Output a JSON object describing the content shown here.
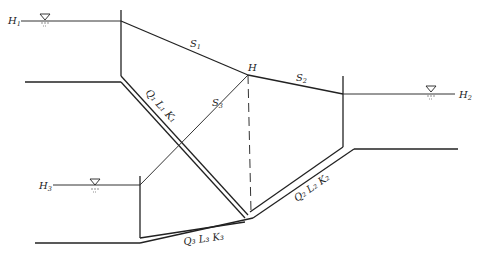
{
  "diagram": {
    "type": "three-reservoir pipe network",
    "reservoirs": [
      {
        "id": "reservoir-1",
        "head_label": "H",
        "head_sub": "1"
      },
      {
        "id": "reservoir-2",
        "head_label": "H",
        "head_sub": "2"
      },
      {
        "id": "reservoir-3",
        "head_label": "H",
        "head_sub": "3"
      }
    ],
    "junction": {
      "label": "H"
    },
    "hydraulic_grade_lines": [
      {
        "label": "S",
        "sub": "1"
      },
      {
        "label": "S",
        "sub": "2"
      },
      {
        "label": "S",
        "sub": "3"
      }
    ],
    "pipes": [
      {
        "label": "Q₁ L₁ K₁"
      },
      {
        "label": "Q₂ L₂ K₂"
      },
      {
        "label": "Q₃ L₃ K₃"
      }
    ],
    "water_surface_symbol": "▽"
  }
}
